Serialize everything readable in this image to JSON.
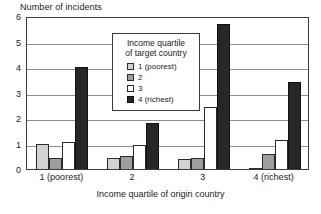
{
  "chart_data": {
    "type": "bar",
    "title": "",
    "ylabel": "Number of incidents",
    "xlabel": "Income quartile of origin country",
    "categories": [
      "1 (poorest)",
      "2",
      "3",
      "4 (richest)"
    ],
    "series": [
      {
        "name": "1 (poorest)",
        "color": "#d2d2d2",
        "values": [
          1.0,
          0.45,
          0.4,
          0.05
        ]
      },
      {
        "name": "2",
        "color": "#9e9e9e",
        "values": [
          0.45,
          0.5,
          0.45,
          0.6
        ]
      },
      {
        "name": "3",
        "color": "#ffffff",
        "values": [
          1.05,
          0.95,
          2.45,
          1.15
        ]
      },
      {
        "name": "4 (richest)",
        "color": "#272727",
        "values": [
          4.0,
          1.8,
          5.7,
          3.4
        ]
      }
    ],
    "ylim": [
      0,
      6
    ],
    "yticks": [
      0,
      1,
      2,
      3,
      4,
      5,
      6
    ],
    "ytick_labels": [
      "0",
      "1",
      "2",
      "3",
      "4",
      "5",
      "6"
    ],
    "grid": true,
    "legend_position": "upper center",
    "legend_title": "Income quartile\nof target country",
    "legend_title_line1": "Income quartile",
    "legend_title_line2": "of target country"
  }
}
